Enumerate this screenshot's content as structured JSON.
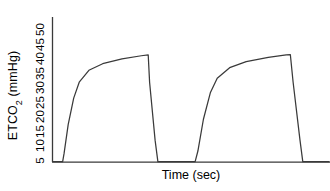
{
  "chart_data": {
    "type": "line",
    "title": "",
    "subtitle": "",
    "xlabel": "Time (sec)",
    "ylabel": "ETCO2 (mmHg)",
    "ylabel_base": "ETCO",
    "ylabel_sub": "2",
    "ylabel_unit": " (mmHg)",
    "yticks": [
      5,
      10,
      15,
      20,
      25,
      30,
      35,
      40,
      45,
      50
    ],
    "ytick_labels": [
      "5",
      "10",
      "15",
      "20",
      "25",
      "30",
      "35",
      "40",
      "45",
      "50"
    ],
    "xticks": [],
    "xtick_labels": [],
    "ylim": [
      0,
      52
    ],
    "xlim": [
      0,
      10
    ],
    "grid": false,
    "legend": null,
    "legend_position": "none",
    "line_color": "#3a3a3a",
    "axis_color": "#3a3a3a",
    "background": "#ffffff",
    "annotations": [],
    "series": [
      {
        "name": "ETCO2 waveform",
        "points": [
          {
            "x": 0.0,
            "y": 0.0
          },
          {
            "x": 0.35,
            "y": 0.0
          },
          {
            "x": 0.4,
            "y": 3.0
          },
          {
            "x": 0.55,
            "y": 14.0
          },
          {
            "x": 0.75,
            "y": 24.0
          },
          {
            "x": 0.95,
            "y": 30.0
          },
          {
            "x": 1.3,
            "y": 34.5
          },
          {
            "x": 1.8,
            "y": 37.0
          },
          {
            "x": 2.5,
            "y": 38.8
          },
          {
            "x": 3.2,
            "y": 40.0
          },
          {
            "x": 3.45,
            "y": 40.3
          },
          {
            "x": 3.5,
            "y": 30.0
          },
          {
            "x": 3.7,
            "y": 8.0
          },
          {
            "x": 3.8,
            "y": 0.0
          },
          {
            "x": 5.15,
            "y": 0.0
          },
          {
            "x": 5.25,
            "y": 4.0
          },
          {
            "x": 5.45,
            "y": 16.0
          },
          {
            "x": 5.7,
            "y": 26.0
          },
          {
            "x": 5.95,
            "y": 31.5
          },
          {
            "x": 6.4,
            "y": 35.5
          },
          {
            "x": 7.0,
            "y": 37.8
          },
          {
            "x": 7.8,
            "y": 39.4
          },
          {
            "x": 8.45,
            "y": 40.3
          },
          {
            "x": 8.6,
            "y": 40.4
          },
          {
            "x": 8.7,
            "y": 30.0
          },
          {
            "x": 8.95,
            "y": 8.0
          },
          {
            "x": 9.05,
            "y": 0.0
          },
          {
            "x": 10.0,
            "y": 0.0
          }
        ]
      }
    ]
  },
  "axes": {
    "y_axis_name": "etco2-axis",
    "x_axis_name": "time-axis"
  }
}
